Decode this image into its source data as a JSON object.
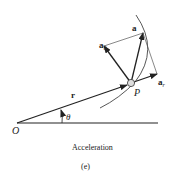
{
  "diagram": {
    "labels": {
      "origin": "O",
      "theta": "θ",
      "r": "r",
      "point": "P",
      "a": "a",
      "a_theta_main": "a",
      "a_theta_sub": "θ",
      "a_r_main": "a",
      "a_r_sub": "r"
    },
    "caption": "Acceleration",
    "subcaption": "(e)",
    "colors": {
      "line": "#222222",
      "thin": "#555555",
      "particle_fill": "#dddddd"
    }
  }
}
